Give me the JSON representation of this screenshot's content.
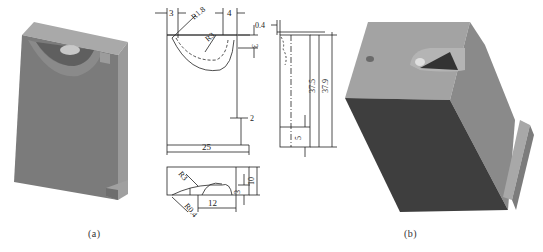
{
  "figure": {
    "caption_a": "(a)",
    "caption_b": "(b)"
  },
  "front_view": {
    "dim_left_offset": "3",
    "dim_radius_outer": "R1.8",
    "dim_radius_inner": "R3",
    "dim_right_offset": "4",
    "dim_depth": "3",
    "dim_step": "2",
    "dim_width": "25"
  },
  "side_view": {
    "dim_lip": "0.4",
    "dim_height_inner": "37.5",
    "dim_height_total": "37.9",
    "dim_base": "5"
  },
  "top_view": {
    "dim_radius": "R3",
    "dim_radius_small": "R0.4",
    "dim_length": "12",
    "dim_depth": "3",
    "dim_thickness": "10"
  },
  "colors": {
    "face_front": "#7a7a7a",
    "face_top": "#a8a8a8",
    "face_side": "#8e8e8e",
    "face_dark": "#3c3c3c",
    "line": "#222222"
  }
}
